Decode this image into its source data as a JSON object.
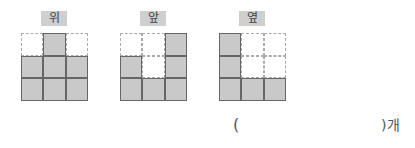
{
  "views": [
    {
      "label": "위",
      "rows": [
        [
          0,
          1,
          0
        ],
        [
          1,
          1,
          1
        ],
        [
          1,
          1,
          1
        ]
      ]
    },
    {
      "label": "앞",
      "rows": [
        [
          0,
          0,
          1
        ],
        [
          1,
          0,
          1
        ],
        [
          1,
          1,
          1
        ]
      ]
    },
    {
      "label": "옆",
      "rows": [
        [
          1,
          0,
          0
        ],
        [
          1,
          0,
          0
        ],
        [
          1,
          1,
          1
        ]
      ]
    }
  ],
  "answer": {
    "open_paren": "(",
    "value": "",
    "close_paren": ")",
    "unit": "개"
  },
  "colors": {
    "filled": "#c9c9c9",
    "border": "#666666",
    "dashed": "#a9a9a9",
    "label_bg": "#cfcfcf"
  }
}
